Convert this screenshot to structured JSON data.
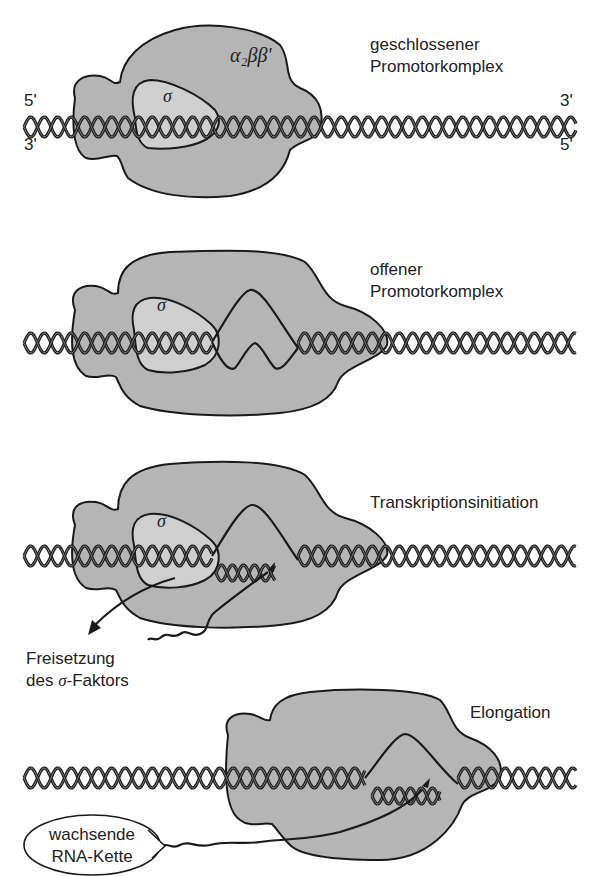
{
  "figure": {
    "panels": [
      {
        "id": "closed",
        "label_line1": "geschlossener",
        "label_line2": "Promotorkomplex",
        "enzyme_label": "α₂ββ'",
        "sigma_label": "σ",
        "strand_ends": {
          "top_left": "5'",
          "bottom_left": "3'",
          "top_right": "3'",
          "bottom_right": "5'"
        }
      },
      {
        "id": "open",
        "label_line1": "offener",
        "label_line2": "Promotorkomplex",
        "sigma_label": "σ"
      },
      {
        "id": "initiation",
        "label": "Transkriptionsinitiation",
        "sigma_label": "σ",
        "release_line1": "Freisetzung",
        "release_line2_pre": "des ",
        "release_line2_sigma": "σ",
        "release_line2_post": "-Faktors"
      },
      {
        "id": "elongation",
        "label": "Elongation",
        "rna_line1": "wachsende",
        "rna_line2": "RNA-Kette"
      }
    ],
    "colors": {
      "enzyme_fill": "#b5b5b5",
      "sigma_fill": "#cfcfcf",
      "outline": "#1a1a1a",
      "background": "#ffffff"
    }
  }
}
